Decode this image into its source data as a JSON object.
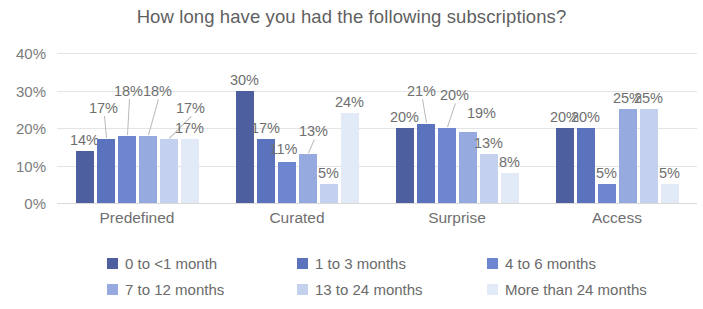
{
  "chart_data": {
    "type": "bar",
    "title": "How long have you had the following subscriptions?",
    "xlabel": "",
    "ylabel": "",
    "ylim": [
      0,
      40
    ],
    "ytick_labels": [
      "0%",
      "10%",
      "20%",
      "30%",
      "40%"
    ],
    "ytick_values": [
      0,
      10,
      20,
      30,
      40
    ],
    "grid": true,
    "legend_position": "bottom",
    "value_suffix": "%",
    "categories": [
      "Predefined",
      "Curated",
      "Surprise",
      "Access"
    ],
    "series": [
      {
        "name": "0 to <1 month",
        "color": "#4e5fa0",
        "values": [
          14,
          30,
          20,
          20
        ],
        "labels": [
          "14%",
          "30%",
          "20%",
          "20%"
        ]
      },
      {
        "name": "1 to 3 months",
        "color": "#5b72bd",
        "values": [
          17,
          17,
          21,
          20
        ],
        "labels": [
          "17%",
          "17%",
          "21%",
          "20%"
        ]
      },
      {
        "name": "4 to 6 months",
        "color": "#6e86cf",
        "values": [
          18,
          11,
          20,
          5
        ],
        "labels": [
          "18%",
          "11%",
          "20%",
          "5%"
        ]
      },
      {
        "name": "7 to 12 months",
        "color": "#96aae0",
        "values": [
          18,
          13,
          19,
          25
        ],
        "labels": [
          "18%",
          "13%",
          "19%",
          "25%"
        ]
      },
      {
        "name": "13 to 24 months",
        "color": "#c3d1ef",
        "values": [
          17,
          5,
          13,
          25
        ],
        "labels": [
          "17%",
          "5%",
          "13%",
          "25%"
        ]
      },
      {
        "name": "More than 24 months",
        "color": "#e2eaf8",
        "values": [
          17,
          24,
          8,
          5
        ],
        "labels": [
          "17%",
          "24%",
          "8%",
          "5%"
        ]
      }
    ]
  },
  "colors": {
    "background": "#ffffff",
    "title_text": "#5f5f5f",
    "axis_text": "#7b7b7b",
    "label_text": "#6f6f6f",
    "gridline": "#e4e4e4",
    "leader_line": "#b9b9b9"
  }
}
